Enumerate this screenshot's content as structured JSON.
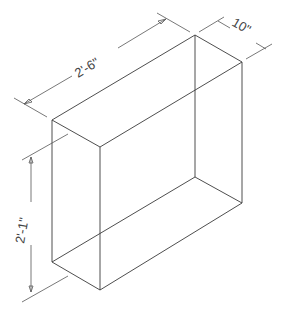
{
  "drawing": {
    "type": "isometric box",
    "dimensions": {
      "length": "2'-6\"",
      "depth": "10\"",
      "height": "2'-1\""
    },
    "colors": {
      "line": "#3a3a3a",
      "background": "#ffffff"
    }
  }
}
